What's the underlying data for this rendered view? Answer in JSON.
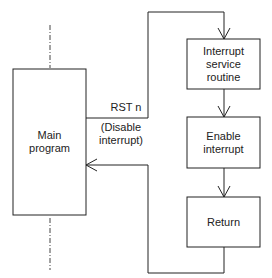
{
  "diagram": {
    "type": "flowchart",
    "nodes": [
      {
        "id": "main",
        "label_line1": "Main",
        "label_line2": "program"
      },
      {
        "id": "isr",
        "label_line1": "Interrupt",
        "label_line2": "service",
        "label_line3": "routine"
      },
      {
        "id": "enable",
        "label_line1": "Enable",
        "label_line2": "interrupt"
      },
      {
        "id": "return",
        "label_line1": "Return"
      }
    ],
    "edges": [
      {
        "from": "main",
        "to": "isr",
        "label": "RST n"
      },
      {
        "from": "isr",
        "to": "enable"
      },
      {
        "from": "enable",
        "to": "return"
      },
      {
        "from": "return",
        "to": "main"
      }
    ],
    "annotation": {
      "line1": "(Disable",
      "line2": "interrupt)"
    },
    "rst_label": "RST n",
    "colors": {
      "line": "#222222",
      "background": "#ffffff"
    }
  }
}
